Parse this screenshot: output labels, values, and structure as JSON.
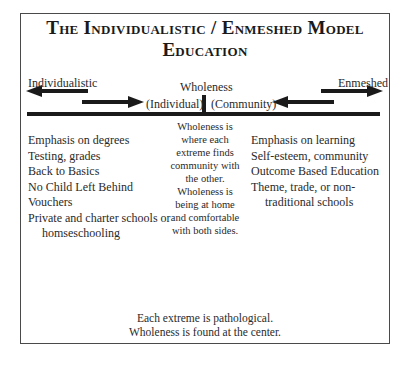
{
  "diagram": {
    "title_line1": "The Individualistic / Enmeshed Model",
    "title_line2": "Education",
    "spectrum": {
      "left_pole": "Individualistic",
      "center_label": "Wholeness",
      "right_pole": "Enmeshed",
      "center_left": "(Individual)",
      "center_right": "(Community)"
    },
    "left_column": {
      "items": [
        "Emphasis on degrees",
        "Testing, grades",
        "Back to Basics",
        "No Child Left Behind",
        "Vouchers",
        "Private and charter schools or",
        "homseschooling"
      ]
    },
    "center_column": {
      "lines": [
        "Wholeness is",
        "where each",
        "extreme finds",
        "community with",
        "the other.",
        "Wholeness is",
        "being at home",
        "and comfortable",
        "with both sides."
      ]
    },
    "right_column": {
      "items": [
        "Emphasis on learning",
        "Self-esteem, community",
        "Outcome Based Education",
        "Theme, trade, or non-",
        "traditional schools"
      ]
    },
    "footer": {
      "line1": "Each extreme is pathological.",
      "line2": "Wholeness is found at the center."
    },
    "colors": {
      "ink": "#1a1a1a",
      "border": "#4a4a4a",
      "background": "#ffffff"
    }
  }
}
